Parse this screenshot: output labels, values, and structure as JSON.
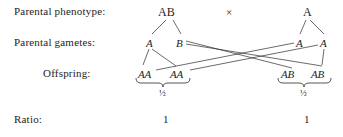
{
  "labels": {
    "phenotype": "Parental phenotype:",
    "gametes": "Parental gametes:",
    "offspring": "Offspring:",
    "ratio": "Ratio:"
  },
  "cross_symbol": "×",
  "parents": [
    {
      "genotype": "AB",
      "side": "left"
    },
    {
      "genotype": "A",
      "side": "right"
    }
  ],
  "gametes": [
    {
      "allele": "A",
      "parent": "left"
    },
    {
      "allele": "B",
      "parent": "left"
    },
    {
      "allele": "A",
      "parent": "right"
    },
    {
      "allele": "A",
      "parent": "right"
    }
  ],
  "offspring": [
    {
      "genotype": "AA",
      "group": "left"
    },
    {
      "genotype": "AA",
      "group": "left"
    },
    {
      "genotype": "AB",
      "group": "right"
    },
    {
      "genotype": "AB",
      "group": "right"
    }
  ],
  "proportions": [
    {
      "value": "½",
      "group": "left"
    },
    {
      "value": "½",
      "group": "right"
    }
  ],
  "ratio_values": [
    {
      "value": "1",
      "group": "left"
    },
    {
      "value": "1",
      "group": "right"
    }
  ],
  "colors": {
    "background": "#ffffff",
    "text": "#1d1d1d",
    "line": "#2b2b2b"
  }
}
